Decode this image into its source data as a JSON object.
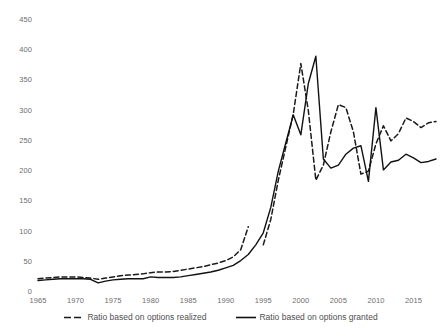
{
  "chart_data": {
    "type": "line",
    "title": "",
    "subtitle": "",
    "xlabel": "",
    "ylabel": "",
    "xlim": [
      1965,
      2018
    ],
    "ylim": [
      0,
      450
    ],
    "grid": false,
    "legend_position": "bottom",
    "y_ticks": [
      0,
      50,
      100,
      150,
      200,
      250,
      300,
      350,
      400,
      450
    ],
    "x_ticks": [
      1965,
      1970,
      1975,
      1980,
      1985,
      1990,
      1995,
      2000,
      2005,
      2010,
      2015
    ],
    "x": [
      1965,
      1966,
      1967,
      1968,
      1969,
      1970,
      1971,
      1972,
      1973,
      1974,
      1975,
      1976,
      1977,
      1978,
      1979,
      1980,
      1981,
      1982,
      1983,
      1984,
      1985,
      1986,
      1987,
      1988,
      1989,
      1990,
      1991,
      1992,
      1993,
      1994,
      1995,
      1996,
      1997,
      1998,
      1999,
      2000,
      2001,
      2002,
      2003,
      2004,
      2005,
      2006,
      2007,
      2008,
      2009,
      2010,
      2011,
      2012,
      2013,
      2014,
      2015,
      2016,
      2017,
      2018
    ],
    "series": [
      {
        "name": "Ratio based on options realized",
        "style": "dashed",
        "color": "#1a1a1a",
        "values": [
          22,
          23,
          24,
          25,
          25,
          25,
          24,
          23,
          21,
          23,
          25,
          27,
          28,
          29,
          30,
          32,
          33,
          33,
          34,
          36,
          38,
          40,
          42,
          45,
          48,
          52,
          58,
          70,
          108,
          null,
          78,
          120,
          185,
          240,
          295,
          378,
          300,
          185,
          210,
          265,
          310,
          305,
          265,
          195,
          200,
          245,
          275,
          250,
          262,
          288,
          282,
          272,
          280,
          282
        ]
      },
      {
        "name": "Ratio based on options granted",
        "style": "solid",
        "color": "#111111",
        "values": [
          19,
          20,
          21,
          22,
          22,
          22,
          22,
          21,
          15,
          18,
          20,
          21,
          22,
          22,
          22,
          25,
          24,
          24,
          24,
          25,
          27,
          29,
          31,
          33,
          36,
          40,
          44,
          52,
          62,
          78,
          98,
          140,
          200,
          247,
          293,
          260,
          345,
          390,
          220,
          205,
          210,
          228,
          238,
          242,
          183,
          305,
          202,
          215,
          218,
          228,
          222,
          214,
          216,
          220
        ]
      }
    ]
  },
  "legend": {
    "items": [
      {
        "label": "Ratio based on options realized",
        "style": "dashed"
      },
      {
        "label": "Ratio based on options granted",
        "style": "solid"
      }
    ]
  },
  "axes": {
    "y_tick_labels": [
      "450",
      "400",
      "350",
      "300",
      "250",
      "200",
      "150",
      "100",
      "50",
      "0"
    ],
    "x_tick_labels": [
      "1965",
      "1970",
      "1975",
      "1980",
      "1985",
      "1990",
      "1995",
      "2000",
      "2005",
      "2010",
      "2015"
    ]
  },
  "colors": {
    "background": "#ffffff",
    "tick_text": "#6e6e6e",
    "legend_text": "#4f4f4f",
    "series_realized": "#1a1a1a",
    "series_granted": "#111111"
  }
}
